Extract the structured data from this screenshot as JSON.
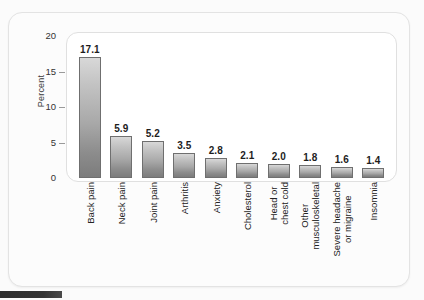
{
  "chart_data": {
    "type": "bar",
    "title": "",
    "xlabel": "",
    "ylabel": "Percent",
    "ylim": [
      0,
      20
    ],
    "yticks": [
      "0",
      "5",
      "10",
      "15",
      "20"
    ],
    "grid": false,
    "legend": "none",
    "categories": [
      "Back pain",
      "Neck pain",
      "Joint pain",
      "Arthritis",
      "Anxiety",
      "Cholesterol",
      "Head or chest cold",
      "Other musculoskeletal",
      "Severe headache or migraine",
      "Insomnia"
    ],
    "category_lines": [
      [
        "Back pain"
      ],
      [
        "Neck pain"
      ],
      [
        "Joint pain"
      ],
      [
        "Arthritis"
      ],
      [
        "Anxiety"
      ],
      [
        "Cholesterol"
      ],
      [
        "Head or",
        "chest cold"
      ],
      [
        "Other",
        "musculoskeletal"
      ],
      [
        "Severe headache",
        "or migraine"
      ],
      [
        "Insomnia"
      ]
    ],
    "values": [
      17.1,
      5.9,
      5.2,
      3.5,
      2.8,
      2.1,
      2.0,
      1.8,
      1.6,
      1.4
    ],
    "value_labels": [
      "17.1",
      "5.9",
      "5.2",
      "3.5",
      "2.8",
      "2.1",
      "2.0",
      "1.8",
      "1.6",
      "1.4"
    ]
  },
  "colors": {
    "page_background": "#fbfbfb",
    "frame_background": "#fcfcfc",
    "plot_background": "#ffffff",
    "frame_border": "#e3e3e3",
    "bar_top": "#d8d8d8",
    "bar_bottom": "#7c7c7c",
    "bar_outline": "#6f6f6f",
    "text": "#232323",
    "tick_mark": "#9a9a9a",
    "edge_strip": "#2e2e2e"
  }
}
